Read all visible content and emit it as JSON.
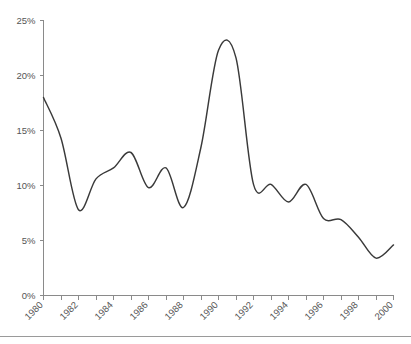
{
  "chart_data": {
    "type": "line",
    "title": "",
    "subtitle": "",
    "xlabel": "",
    "ylabel": "",
    "xlim": [
      1980,
      2000
    ],
    "ylim": [
      0,
      25
    ],
    "grid": false,
    "legend": false,
    "legend_position": "none",
    "line_color": "#3a3a3a",
    "axis_color": "#8a8a8a",
    "tick_label_color": "#555555",
    "y_ticks": [
      0,
      5,
      10,
      15,
      20,
      25
    ],
    "y_tick_labels": [
      "0%",
      "5%",
      "10%",
      "15%",
      "20%",
      "25%"
    ],
    "x_ticks": [
      1980,
      1981,
      1982,
      1983,
      1984,
      1985,
      1986,
      1987,
      1988,
      1989,
      1990,
      1991,
      1992,
      1993,
      1994,
      1995,
      1996,
      1997,
      1998,
      1999,
      2000
    ],
    "x_tick_labels": [
      "1980",
      "",
      "1982",
      "",
      "1984",
      "",
      "1986",
      "",
      "1988",
      "",
      "1990",
      "",
      "1992",
      "",
      "1994",
      "",
      "1996",
      "",
      "1998",
      "",
      "2000"
    ],
    "x_labeled_ticks": [
      1980,
      1982,
      1984,
      1986,
      1988,
      1990,
      1992,
      1994,
      1996,
      1998,
      2000
    ],
    "x_labeled_text": [
      "1980",
      "1982",
      "1984",
      "1986",
      "1988",
      "1990",
      "1992",
      "1994",
      "1996",
      "1998",
      "2000"
    ],
    "x_tick_label_rotation_deg": 45,
    "series": [
      {
        "name": "rate",
        "x": [
          1980,
          1981,
          1982,
          1983,
          1984,
          1985,
          1986,
          1987,
          1988,
          1989,
          1990,
          1991,
          1992,
          1993,
          1994,
          1995,
          1996,
          1997,
          1998,
          1999,
          2000
        ],
        "values": [
          18.0,
          14.3,
          7.8,
          10.6,
          11.6,
          13.0,
          9.8,
          11.6,
          8.0,
          13.5,
          22.3,
          21.6,
          10.1,
          10.1,
          8.5,
          10.1,
          7.0,
          6.9,
          5.3,
          3.4,
          4.6
        ]
      }
    ]
  }
}
